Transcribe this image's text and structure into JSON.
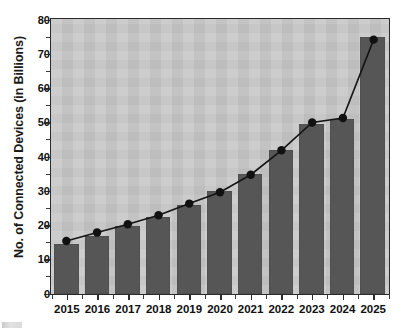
{
  "chart_data": {
    "type": "bar",
    "title": "",
    "subtitle": "",
    "xlabel": "",
    "ylabel": "No. of Connected Devices (in Billions)",
    "categories": [
      "2015",
      "2016",
      "2017",
      "2018",
      "2019",
      "2020",
      "2021",
      "2022",
      "2023",
      "2024",
      "2025"
    ],
    "series": [
      {
        "name": "Connected devices (bars)",
        "type": "bar",
        "values": [
          14.5,
          17,
          20,
          22.5,
          26,
          30,
          35,
          42,
          49.5,
          51,
          75
        ]
      },
      {
        "name": "Connected devices (trend line)",
        "type": "line",
        "values": [
          15.4,
          17.9,
          20.3,
          22.9,
          26.3,
          29.6,
          34.7,
          41.8,
          49.9,
          51.2,
          74
        ]
      }
    ],
    "ylim": [
      0,
      80
    ],
    "ytick_labels": [
      "0",
      "10",
      "20",
      "30",
      "40",
      "50",
      "60",
      "70",
      "80"
    ],
    "ytick_values": [
      0,
      10,
      20,
      30,
      40,
      50,
      60,
      70,
      80
    ],
    "grid": false,
    "legend": "none",
    "colors": {
      "bar": "#565656",
      "line": "#141414",
      "marker": "#111111",
      "plot_background": "#c8c8c8",
      "figure_background": "#ffffff",
      "axis": "#2a2a2a",
      "text": "#101010"
    }
  }
}
